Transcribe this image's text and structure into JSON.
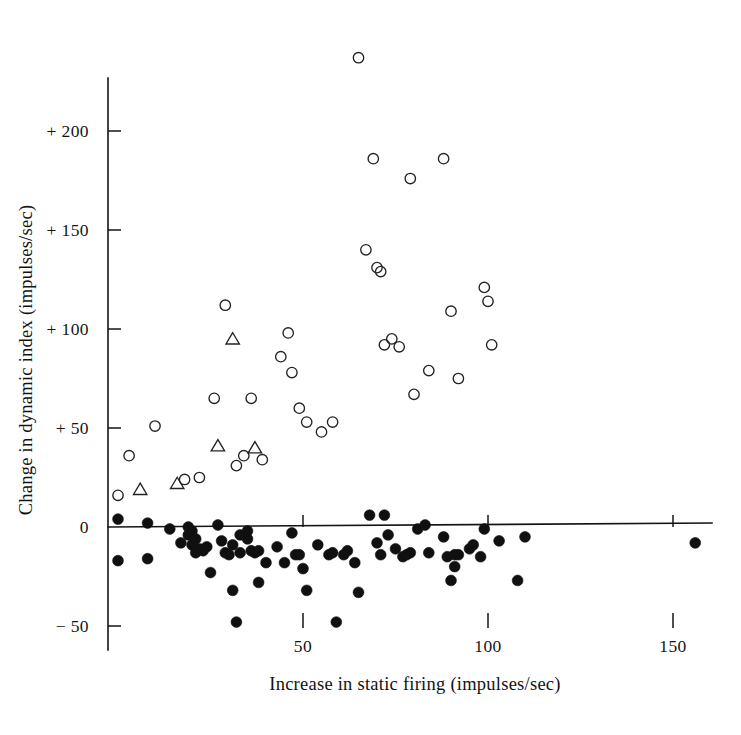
{
  "figure": {
    "background_color": "#ffffff",
    "ink_color": "#141414"
  },
  "chart_data": {
    "type": "scatter",
    "title": "",
    "subtitle": "",
    "xlabel": "Increase in static firing (impulses/sec)",
    "ylabel": "Change in dynamic index (impulses/sec)",
    "xlim": [
      -3,
      168
    ],
    "ylim": [
      -62,
      248
    ],
    "grid": false,
    "legend_position": "none",
    "x_ticks": [
      50,
      100,
      150
    ],
    "x_tick_labels": [
      "50",
      "100",
      "150"
    ],
    "y_ticks": [
      -50,
      0,
      50,
      100,
      150,
      200
    ],
    "y_tick_labels": [
      "− 50",
      "0",
      "+ 50",
      "+ 100",
      "+ 150",
      "+ 200"
    ],
    "zero_line": 0,
    "annotations": [],
    "series": [
      {
        "name": "open-circle",
        "marker": "open-circle",
        "color": "#232323",
        "count": 41,
        "points": [
          [
            0.0,
            16.0
          ],
          [
            3.0,
            36.0
          ],
          [
            10.0,
            51.0
          ],
          [
            18.0,
            24.0
          ],
          [
            22.0,
            25.0
          ],
          [
            26.0,
            65.0
          ],
          [
            29.0,
            112.0
          ],
          [
            32.0,
            31.0
          ],
          [
            34.0,
            36.0
          ],
          [
            36.0,
            65.0
          ],
          [
            39.0,
            34.0
          ],
          [
            44.0,
            86.0
          ],
          [
            46.0,
            98.0
          ],
          [
            47.0,
            78.0
          ],
          [
            49.0,
            60.0
          ],
          [
            51.0,
            53.0
          ],
          [
            55.0,
            48.0
          ],
          [
            58.0,
            53.0
          ],
          [
            65.0,
            237.0
          ],
          [
            67.0,
            140.0
          ],
          [
            69.0,
            186.0
          ],
          [
            70.0,
            131.0
          ],
          [
            71.0,
            129.0
          ],
          [
            72.0,
            92.0
          ],
          [
            74.0,
            95.0
          ],
          [
            76.0,
            91.0
          ],
          [
            79.0,
            176.0
          ],
          [
            80.0,
            67.0
          ],
          [
            84.0,
            79.0
          ],
          [
            88.0,
            186.0
          ],
          [
            90.0,
            109.0
          ],
          [
            92.0,
            75.0
          ],
          [
            99.0,
            121.0
          ],
          [
            100.0,
            114.0
          ],
          [
            101.0,
            92.0
          ]
        ]
      },
      {
        "name": "open-triangle",
        "marker": "open-triangle",
        "color": "#232323",
        "count": 5,
        "points": [
          [
            6.0,
            19.0
          ],
          [
            16.0,
            22.0
          ],
          [
            27.0,
            41.0
          ],
          [
            31.0,
            95.0
          ],
          [
            37.0,
            40.0
          ]
        ]
      },
      {
        "name": "filled-circle",
        "marker": "filled-circle",
        "color": "#101010",
        "count": 72,
        "points": [
          [
            0.0,
            4.0
          ],
          [
            0.0,
            -17.0
          ],
          [
            8.0,
            2.0
          ],
          [
            8.0,
            -16.0
          ],
          [
            14.0,
            -1.0
          ],
          [
            17.0,
            -8.0
          ],
          [
            19.0,
            0.0
          ],
          [
            19.0,
            -4.0
          ],
          [
            20.0,
            -2.0
          ],
          [
            20.0,
            -9.0
          ],
          [
            21.0,
            -6.0
          ],
          [
            21.0,
            -13.0
          ],
          [
            22.0,
            -11.0
          ],
          [
            23.0,
            -12.0
          ],
          [
            24.0,
            -10.0
          ],
          [
            25.0,
            -23.0
          ],
          [
            27.0,
            1.0
          ],
          [
            28.0,
            -7.0
          ],
          [
            29.0,
            -13.0
          ],
          [
            30.0,
            -14.0
          ],
          [
            31.0,
            -9.0
          ],
          [
            31.0,
            -32.0
          ],
          [
            32.0,
            -48.0
          ],
          [
            33.0,
            -4.0
          ],
          [
            33.0,
            -13.0
          ],
          [
            35.0,
            -2.0
          ],
          [
            35.0,
            -6.0
          ],
          [
            36.0,
            -12.0
          ],
          [
            37.0,
            -13.0
          ],
          [
            38.0,
            -12.0
          ],
          [
            38.0,
            -28.0
          ],
          [
            40.0,
            -18.0
          ],
          [
            43.0,
            -10.0
          ],
          [
            45.0,
            -18.0
          ],
          [
            47.0,
            -3.0
          ],
          [
            48.0,
            -14.0
          ],
          [
            49.0,
            -14.0
          ],
          [
            50.0,
            -21.0
          ],
          [
            51.0,
            -32.0
          ],
          [
            54.0,
            -9.0
          ],
          [
            57.0,
            -14.0
          ],
          [
            58.0,
            -13.0
          ],
          [
            59.0,
            -48.0
          ],
          [
            61.0,
            -14.0
          ],
          [
            62.0,
            -12.0
          ],
          [
            64.0,
            -18.0
          ],
          [
            65.0,
            -33.0
          ],
          [
            68.0,
            6.0
          ],
          [
            70.0,
            -8.0
          ],
          [
            71.0,
            -14.0
          ],
          [
            72.0,
            6.0
          ],
          [
            73.0,
            -4.0
          ],
          [
            75.0,
            -11.0
          ],
          [
            77.0,
            -15.0
          ],
          [
            78.0,
            -14.0
          ],
          [
            79.0,
            -13.0
          ],
          [
            81.0,
            -1.0
          ],
          [
            83.0,
            1.0
          ],
          [
            84.0,
            -13.0
          ],
          [
            88.0,
            -5.0
          ],
          [
            89.0,
            -15.0
          ],
          [
            90.0,
            -27.0
          ],
          [
            91.0,
            -14.0
          ],
          [
            91.0,
            -20.0
          ],
          [
            92.0,
            -14.0
          ],
          [
            95.0,
            -11.0
          ],
          [
            96.0,
            -9.0
          ],
          [
            98.0,
            -15.0
          ],
          [
            99.0,
            -1.0
          ],
          [
            103.0,
            -7.0
          ],
          [
            108.0,
            -27.0
          ],
          [
            110.0,
            -5.0
          ],
          [
            156.0,
            -8.0
          ]
        ]
      }
    ]
  },
  "geometry": {
    "x_axis_px_at_zero": 118,
    "x_axis_px_per_unit": 3.7,
    "y_axis_px_at_zero": 527,
    "y_axis_px_per_unit": 1.98,
    "y_axis_x_px": 108,
    "y_axis_top_px": 78,
    "y_axis_bottom_px": 650,
    "x_axis_right_px": 712,
    "tick_len_px": 13,
    "open_circle_r": 5.2,
    "filled_circle_r": 5.4,
    "triangle_half": 6.2
  }
}
